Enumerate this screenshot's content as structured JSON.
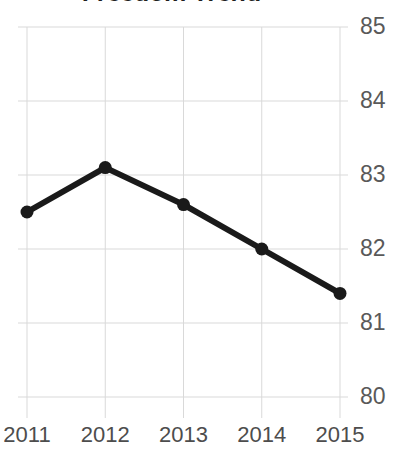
{
  "chart_data": {
    "type": "line",
    "title": "Freedom Trend",
    "xlabel": "",
    "ylabel": "",
    "categories": [
      "2011",
      "2012",
      "2013",
      "2014",
      "2015"
    ],
    "values": [
      82.5,
      83.1,
      82.6,
      82.0,
      81.4
    ],
    "series": [
      {
        "name": "Freedom Score",
        "values": [
          82.5,
          83.1,
          82.6,
          82.0,
          81.4
        ]
      }
    ],
    "ylim": [
      80,
      85
    ],
    "xlim": [
      "2011",
      "2015"
    ],
    "ytick_labels": [
      "85",
      "84",
      "83",
      "82",
      "81",
      "80"
    ],
    "ytick_values": [
      85,
      84,
      83,
      82,
      81,
      80
    ],
    "xtick_labels": [
      "2011",
      "2012",
      "2013",
      "2014",
      "2015"
    ],
    "grid": true,
    "grid_horizontal": true,
    "grid_vertical": true,
    "legend": false,
    "legend_position": "none",
    "y_axis_position": "right",
    "marker": "circle",
    "colors": {
      "line": "#1a1a1a",
      "marker": "#1a1a1a",
      "grid": "#d9d9d9",
      "tick_label": "#595959",
      "title": "#1f1f1f",
      "background": "#ffffff"
    }
  }
}
